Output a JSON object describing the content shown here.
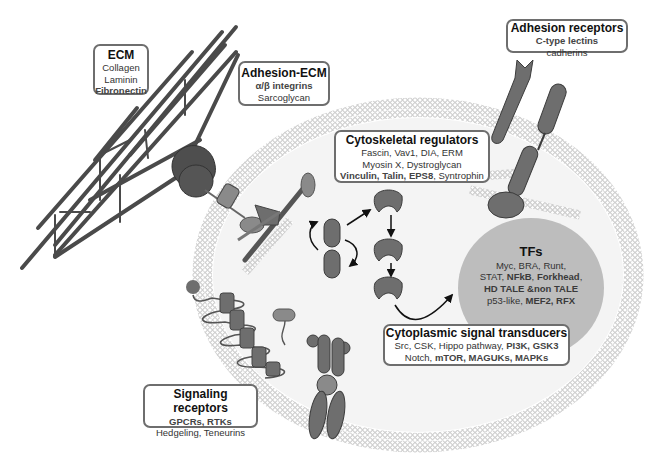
{
  "diagram": {
    "type": "cell-signaling-schematic",
    "colors": {
      "protein_fill": "#6e6e6e",
      "protein_stroke": "#3c3c3c",
      "membrane": "#b5b5b5",
      "tf_circle": "#bdbdbd",
      "box_border": "#6e6e6e"
    }
  },
  "labels": {
    "ecm": {
      "title": "ECM",
      "lines": [
        "Collagen",
        "Laminin",
        "Fibronectin"
      ]
    },
    "adhesion_ecm": {
      "title": "Adhesion-ECM",
      "lines": [
        "α/β integrins",
        "Sarcoglycan"
      ]
    },
    "adhesion_receptors": {
      "title": "Adhesion receptors",
      "lines": [
        "C-type lectins",
        "cadherins"
      ]
    },
    "cytoskeletal_regulators": {
      "title": "Cytoskeletal regulators",
      "lines": [
        "Fascin, Vav1, DIA, ERM",
        "Myosin X, Dystroglycan"
      ],
      "line3_parts": [
        "Vinculin, Talin, EPS8",
        ", Syntrophin"
      ]
    },
    "tfs": {
      "title": "TFs",
      "line1": "Myc, BRA, Runt,",
      "line2_parts": [
        "STAT, ",
        "NFkB",
        ", ",
        "Forkhead",
        ","
      ],
      "line3": "HD TALE &non TALE",
      "line4_parts": [
        "p53-like, ",
        "MEF2, RFX"
      ]
    },
    "cytoplasmic_signal_transducers": {
      "title": "Cytoplasmic signal transducers",
      "line1_parts": [
        "Src, CSK, Hippo pathway, ",
        "PI3K, GSK3"
      ],
      "line2_parts": [
        "Notch, ",
        "mTOR, MAGUKs, MAPKs"
      ]
    },
    "signaling_receptors": {
      "title": "Signaling receptors",
      "line1": "GPCRs, RTKs",
      "line2": "Hedgeling, Teneurins"
    }
  }
}
